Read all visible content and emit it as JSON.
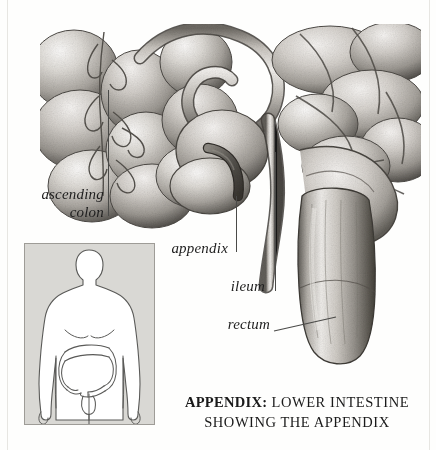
{
  "figure": {
    "type": "anatomical-illustration",
    "subject": "lower intestine showing the appendix",
    "style": "engraved stipple halftone, grayscale"
  },
  "labels": [
    {
      "id": "ascending-colon",
      "text": "ascending\ncolon",
      "line1": "ascending",
      "line2": "colon",
      "style": "italic-serif"
    },
    {
      "id": "appendix",
      "text": "appendix",
      "style": "italic-serif"
    },
    {
      "id": "ileum",
      "text": "ileum",
      "style": "italic-serif"
    },
    {
      "id": "rectum",
      "text": "rectum",
      "style": "italic-serif"
    }
  ],
  "caption": {
    "term": "APPENDIX:",
    "line1_rest": " LOWER INTESTINE",
    "line2": "SHOWING THE APPENDIX"
  },
  "inset": {
    "name": "body-locator-diagram",
    "description": "front view of human torso with large intestine outlined",
    "background_color": "#d9d8d4",
    "body_color": "#ffffff",
    "outline_color": "#5a5a58"
  },
  "colors": {
    "page_background": "#fefefd",
    "leader_line": "#4a4a48",
    "label_text": "#1e1e1e",
    "caption_text": "#1a1a1a",
    "tissue_light": "#f2f0ee",
    "tissue_mid": "#b9b6b1",
    "tissue_dark": "#6e6b66",
    "tissue_shadow": "#3d3b38",
    "appendix_dark": "#4e4b47"
  }
}
